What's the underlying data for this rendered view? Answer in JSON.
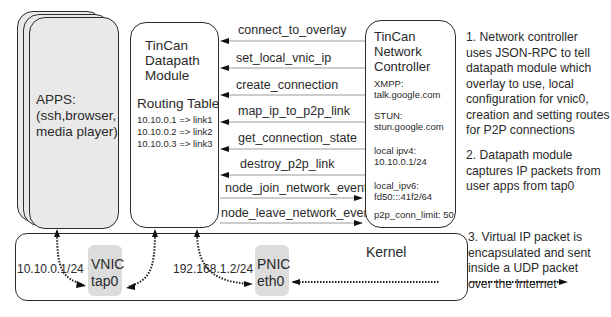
{
  "apps": {
    "label_line1": "APPS:",
    "label_line2": "(ssh,browser,",
    "label_line3": "media player)"
  },
  "datapath": {
    "title_line1": "TinCan",
    "title_line2": "Datapath",
    "title_line3": "Module",
    "routing_title": "Routing Table",
    "routes": [
      "10.10.0.1 => link1",
      "10.10.0.2 => link2",
      "10.10.0.3 => link3"
    ]
  },
  "rpc_calls": [
    {
      "label": "connect_to_overlay",
      "direction": "to-datapath"
    },
    {
      "label": "set_local_vnic_ip",
      "direction": "to-datapath"
    },
    {
      "label": "create_connection",
      "direction": "to-datapath"
    },
    {
      "label": "map_ip_to_p2p_link",
      "direction": "to-datapath"
    },
    {
      "label": "get_connection_state",
      "direction": "to-datapath"
    },
    {
      "label": "destroy_p2p_link",
      "direction": "to-datapath"
    },
    {
      "label": "node_join_network_event",
      "direction": "to-controller"
    },
    {
      "label": "node_leave_network_event",
      "direction": "to-controller"
    }
  ],
  "controller": {
    "title_line1": "TinCan",
    "title_line2": "Network",
    "title_line3": "Controller",
    "xmpp_label": "XMPP:",
    "xmpp_value": "talk.google.com",
    "stun_label": "STUN:",
    "stun_value": "stun.google.com",
    "ipv4_label": "local ipv4:",
    "ipv4_value": "10.10.0.1/24",
    "ipv6_label": "local_ipv6:",
    "ipv6_value": "fd50:::41f2/64",
    "conn_limit": "p2p_conn_limit: 50"
  },
  "kernel": {
    "label": "Kernel",
    "vnic_line1": "VNIC",
    "vnic_line2": "tap0",
    "vnic_ip": "10.10.0.1/24",
    "pnic_line1": "PNIC",
    "pnic_line2": "eth0",
    "pnic_ip": "192.168.1.2/24"
  },
  "notes": {
    "note1": [
      "1. Network controller",
      "uses JSON-RPC to tell",
      "datapath module which",
      "overlay to use, local",
      "configuration for vnic0,",
      "creation and setting routes",
      "for P2P connections"
    ],
    "note2": [
      "2. Datapath module",
      "captures IP packets from",
      "user apps from tap0"
    ],
    "note3": [
      "3. Virtual IP packet is",
      "encapsulated and sent",
      "inside a UDP packet",
      "over the Internet"
    ]
  },
  "colors": {
    "stroke": "#2c2c2c",
    "apps_fill": "#e9e9e9",
    "nic_fill": "#dcdcdc",
    "rpc_line": "#9a9a9a"
  }
}
